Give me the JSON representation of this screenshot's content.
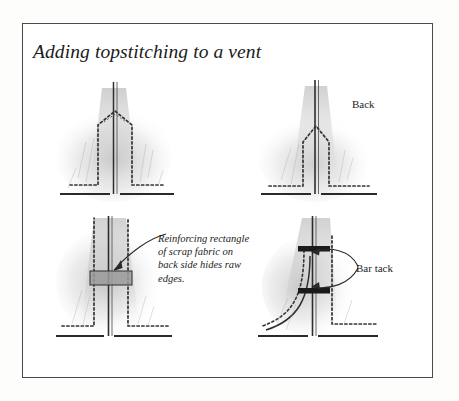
{
  "page": {
    "background_color": "#fdfdfc",
    "width": 459,
    "height": 401
  },
  "frame": {
    "border_color": "#4a4a4a",
    "fill_color": "#ffffff"
  },
  "title": "Adding topstitching to a vent",
  "labels": {
    "back": "Back",
    "bar_tack": "Bar tack",
    "reinforcing_caption": "Reinforcing rectangle of scrap fabric on back side hides raw edges."
  },
  "colors": {
    "ink": "#1b1b1b",
    "stitch": "#3a3a3a",
    "pencil_shading": "#b9b9b9",
    "reinforcing_patch": "#9a9a9a",
    "bar_tack": "#1a1a1a"
  },
  "figures": [
    {
      "id": "fig-tl",
      "name": "vent-with-topstitching-front",
      "position": "top-left",
      "description": "Garment vent slit with dotted topstitching forming a wide triangular point at the top and dotted hem stitching along the bottom edge."
    },
    {
      "id": "fig-tr",
      "name": "vent-back-view",
      "position": "top-right",
      "description": "Back view of the vent with a narrow pointed topstitching shape and dotted hem stitching.",
      "label": "Back"
    },
    {
      "id": "fig-bl",
      "name": "vent-with-reinforcing-rectangle",
      "position": "bottom-left",
      "description": "Vent with a gray reinforcing rectangle of scrap fabric crossing the slit at mid height, pointed out by a curved arrow.",
      "callout": "Reinforcing rectangle of scrap fabric on back side hides raw edges."
    },
    {
      "id": "fig-br",
      "name": "vent-with-bar-tacks",
      "position": "bottom-right",
      "description": "Vent with two horizontal dark bar tacks crossing the slit, indicated by two curved arrows converging on one label.",
      "callout": "Bar tack"
    }
  ]
}
